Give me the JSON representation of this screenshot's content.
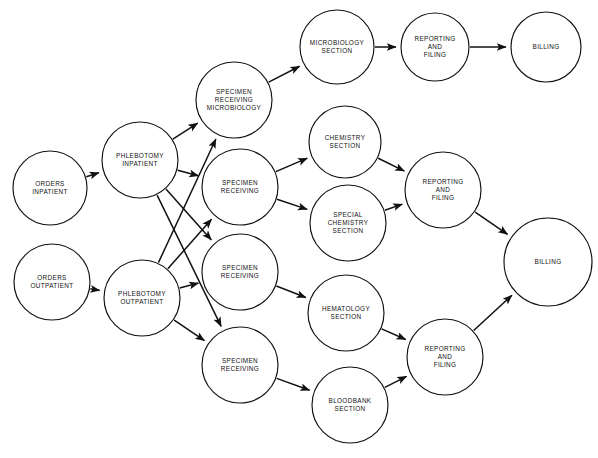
{
  "diagram": {
    "type": "flowchart",
    "style": {
      "node_shape": "circle",
      "node_fill": "#ffffff",
      "stroke": "#111111",
      "background": "#ffffff"
    },
    "nodes": [
      {
        "id": "orders_in",
        "lines": [
          "ORDERS",
          "INPATIENT"
        ],
        "cx": 50,
        "cy": 188,
        "r": 37
      },
      {
        "id": "orders_out",
        "lines": [
          "ORDERS",
          "OUTPATIENT"
        ],
        "cx": 52,
        "cy": 282,
        "r": 38
      },
      {
        "id": "phleb_in",
        "lines": [
          "PHLEBOTOMY",
          "INPATIENT"
        ],
        "cx": 140,
        "cy": 160,
        "r": 38
      },
      {
        "id": "phleb_out",
        "lines": [
          "PHLEBOTOMY",
          "OUTPATIENT"
        ],
        "cx": 142,
        "cy": 298,
        "r": 38
      },
      {
        "id": "sr_micro",
        "lines": [
          "SPECIMEN",
          "RECEIVING",
          "MICROBIOLOGY"
        ],
        "cx": 234,
        "cy": 100,
        "r": 38
      },
      {
        "id": "sr_chem",
        "lines": [
          "SPECIMEN",
          "RECEIVING"
        ],
        "cx": 240,
        "cy": 187,
        "r": 38
      },
      {
        "id": "sr_hema",
        "lines": [
          "SPECIMEN",
          "RECEIVING"
        ],
        "cx": 240,
        "cy": 272,
        "r": 38
      },
      {
        "id": "sr_blood",
        "lines": [
          "SPECIMEN",
          "RECEIVING"
        ],
        "cx": 240,
        "cy": 365,
        "r": 38
      },
      {
        "id": "micro_sec",
        "lines": [
          "MICROBIOLOGY",
          "SECTION"
        ],
        "cx": 337,
        "cy": 47,
        "r": 37
      },
      {
        "id": "chem_sec",
        "lines": [
          "CHEMISTRY",
          "SECTION"
        ],
        "cx": 345,
        "cy": 142,
        "r": 36
      },
      {
        "id": "spchem_sec",
        "lines": [
          "SPECIAL",
          "CHEMISTRY",
          "SECTION"
        ],
        "cx": 348,
        "cy": 223,
        "r": 38
      },
      {
        "id": "hema_sec",
        "lines": [
          "HEMATOLOGY",
          "SECTION"
        ],
        "cx": 346,
        "cy": 313,
        "r": 38
      },
      {
        "id": "blood_sec",
        "lines": [
          "BLOODBANK",
          "SECTION"
        ],
        "cx": 350,
        "cy": 405,
        "r": 38
      },
      {
        "id": "rep_top",
        "lines": [
          "REPORTING",
          "AND",
          "FILING"
        ],
        "cx": 435,
        "cy": 47,
        "r": 34
      },
      {
        "id": "rep_mid",
        "lines": [
          "REPORTING",
          "AND",
          "FILING"
        ],
        "cx": 443,
        "cy": 190,
        "r": 38
      },
      {
        "id": "rep_bot",
        "lines": [
          "REPORTING",
          "AND",
          "FILING"
        ],
        "cx": 445,
        "cy": 357,
        "r": 38
      },
      {
        "id": "bill_top",
        "lines": [
          "BILLING"
        ],
        "cx": 546,
        "cy": 47,
        "r": 35
      },
      {
        "id": "bill_main",
        "lines": [
          "BILLING"
        ],
        "cx": 548,
        "cy": 262,
        "r": 44
      }
    ],
    "edges": [
      {
        "from": "orders_in",
        "to": "phleb_in",
        "label": ""
      },
      {
        "from": "orders_out",
        "to": "phleb_out",
        "label": ""
      },
      {
        "from": "phleb_in",
        "to": "sr_micro",
        "label": ""
      },
      {
        "from": "phleb_in",
        "to": "sr_chem",
        "label": ""
      },
      {
        "from": "phleb_in",
        "to": "sr_hema",
        "label": ""
      },
      {
        "from": "phleb_in",
        "to": "sr_blood",
        "label": ""
      },
      {
        "from": "phleb_out",
        "to": "sr_micro",
        "label": ""
      },
      {
        "from": "phleb_out",
        "to": "sr_chem",
        "label": ""
      },
      {
        "from": "phleb_out",
        "to": "sr_hema",
        "label": ""
      },
      {
        "from": "phleb_out",
        "to": "sr_blood",
        "label": ""
      },
      {
        "from": "sr_micro",
        "to": "micro_sec",
        "label": ""
      },
      {
        "from": "sr_chem",
        "to": "chem_sec",
        "label": ""
      },
      {
        "from": "sr_chem",
        "to": "spchem_sec",
        "label": ""
      },
      {
        "from": "sr_hema",
        "to": "hema_sec",
        "label": ""
      },
      {
        "from": "sr_blood",
        "to": "blood_sec",
        "label": ""
      },
      {
        "from": "micro_sec",
        "to": "rep_top",
        "label": ""
      },
      {
        "from": "rep_top",
        "to": "bill_top",
        "label": ""
      },
      {
        "from": "chem_sec",
        "to": "rep_mid",
        "label": ""
      },
      {
        "from": "spchem_sec",
        "to": "rep_mid",
        "label": ""
      },
      {
        "from": "hema_sec",
        "to": "rep_bot",
        "label": ""
      },
      {
        "from": "blood_sec",
        "to": "rep_bot",
        "label": ""
      },
      {
        "from": "rep_mid",
        "to": "bill_main",
        "label": ""
      },
      {
        "from": "rep_bot",
        "to": "bill_main",
        "label": ""
      }
    ]
  }
}
